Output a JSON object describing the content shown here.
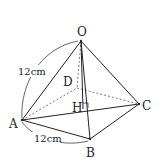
{
  "diagram": {
    "type": "square-pyramid",
    "points": {
      "O": {
        "label": "O",
        "x": 81,
        "y": 41
      },
      "A": {
        "label": "A",
        "x": 22,
        "y": 120
      },
      "B": {
        "label": "B",
        "x": 90,
        "y": 139
      },
      "C": {
        "label": "C",
        "x": 139,
        "y": 104
      },
      "D": {
        "label": "D",
        "x": 77,
        "y": 88
      },
      "H": {
        "label": "H",
        "x": 83,
        "y": 109
      }
    },
    "measurements": {
      "OA": "12cm",
      "AB": "12cm"
    },
    "colors": {
      "line": "#222222",
      "dashed": "#555555",
      "background": "#ffffff"
    }
  }
}
